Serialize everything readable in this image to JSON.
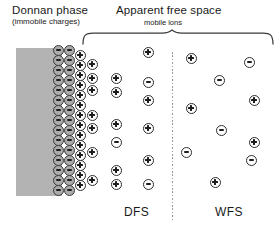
{
  "figure": {
    "type": "schematic-diagram",
    "background_color": "#ffffff"
  },
  "headings": {
    "left": {
      "title": "Donnan phase",
      "subtitle": "(immobile charges)"
    },
    "right": {
      "title": "Apparent free space",
      "subtitle": "mobile ions",
      "brace": "curly-brace-down",
      "brace_span_px": [
        82,
        274
      ]
    }
  },
  "wall": {
    "name": "cell-wall-block",
    "color": "#b3b3b3",
    "x": 16,
    "y": 48,
    "width": 46,
    "height": 148
  },
  "divider": {
    "name": "dfs-wfs-divider",
    "style": "dotted-vertical",
    "color": "#9a9a9a",
    "x": 172,
    "y": 52,
    "height": 168
  },
  "zones": [
    {
      "id": "dfs",
      "label": "DFS",
      "label_x": 124,
      "label_y": 205
    },
    {
      "id": "wfs",
      "label": "WFS",
      "label_x": 215,
      "label_y": 205
    }
  ],
  "ion_glyphs": {
    "plus": "⊕",
    "minus": "⊖",
    "fixed_fill": "#ababab",
    "mobile_fill": "#ffffff",
    "ring_color": "#2e2e2e"
  },
  "ions": {
    "fixed_negative_column_1": {
      "charge": "minus",
      "class": "fixed",
      "zone": "donnan",
      "x": 58,
      "y_positions": [
        50,
        60,
        70,
        80,
        90,
        100,
        110,
        120,
        130,
        140,
        150,
        160,
        170,
        180,
        190
      ]
    },
    "fixed_negative_column_2": {
      "charge": "minus",
      "class": "fixed",
      "zone": "donnan",
      "x": 69,
      "y_positions": [
        50,
        60,
        70,
        80,
        90,
        100,
        110,
        120,
        130,
        140,
        150,
        160,
        170,
        180,
        190
      ]
    },
    "counterion_column_1": {
      "charge": "plus",
      "class": "dense",
      "zone": "donnan",
      "x": 80,
      "y_positions": [
        55,
        65,
        75,
        85,
        95,
        105,
        115,
        125,
        135,
        145,
        155,
        165,
        175,
        185
      ]
    },
    "dfs_column_2": {
      "charge": "mixed",
      "zone": "dfs",
      "points": [
        {
          "x": 92,
          "y": 64,
          "charge": "plus"
        },
        {
          "x": 92,
          "y": 78,
          "charge": "plus"
        },
        {
          "x": 92,
          "y": 90,
          "charge": "plus"
        },
        {
          "x": 92,
          "y": 115,
          "charge": "plus"
        },
        {
          "x": 92,
          "y": 128,
          "charge": "plus"
        },
        {
          "x": 92,
          "y": 152,
          "charge": "plus"
        },
        {
          "x": 92,
          "y": 180,
          "charge": "plus"
        }
      ]
    },
    "dfs_column_3": {
      "charge": "mixed",
      "zone": "dfs",
      "points": [
        {
          "x": 116,
          "y": 78,
          "charge": "plus"
        },
        {
          "x": 116,
          "y": 92,
          "charge": "plus"
        },
        {
          "x": 116,
          "y": 124,
          "charge": "plus"
        },
        {
          "x": 116,
          "y": 142,
          "charge": "minus"
        },
        {
          "x": 116,
          "y": 170,
          "charge": "plus"
        },
        {
          "x": 116,
          "y": 184,
          "charge": "plus"
        }
      ]
    },
    "dfs_column_4": {
      "charge": "mixed",
      "zone": "dfs",
      "points": [
        {
          "x": 148,
          "y": 52,
          "charge": "plus"
        },
        {
          "x": 148,
          "y": 82,
          "charge": "minus"
        },
        {
          "x": 148,
          "y": 100,
          "charge": "plus"
        },
        {
          "x": 148,
          "y": 128,
          "charge": "plus"
        },
        {
          "x": 148,
          "y": 160,
          "charge": "plus"
        },
        {
          "x": 148,
          "y": 184,
          "charge": "minus"
        }
      ]
    },
    "wfs_scatter": {
      "charge": "mixed",
      "zone": "wfs",
      "points": [
        {
          "x": 191,
          "y": 58,
          "charge": "plus"
        },
        {
          "x": 249,
          "y": 62,
          "charge": "minus"
        },
        {
          "x": 219,
          "y": 80,
          "charge": "minus"
        },
        {
          "x": 254,
          "y": 100,
          "charge": "plus"
        },
        {
          "x": 191,
          "y": 108,
          "charge": "plus"
        },
        {
          "x": 221,
          "y": 130,
          "charge": "minus"
        },
        {
          "x": 254,
          "y": 142,
          "charge": "plus"
        },
        {
          "x": 186,
          "y": 152,
          "charge": "minus"
        },
        {
          "x": 251,
          "y": 160,
          "charge": "minus"
        },
        {
          "x": 215,
          "y": 182,
          "charge": "plus"
        }
      ]
    }
  }
}
